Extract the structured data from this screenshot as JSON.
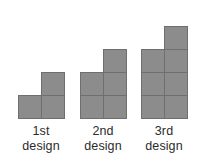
{
  "figure": {
    "background_color": "#ffffff",
    "square_fill_color": "#8c8c8c",
    "square_border_color": "#6f6f6f",
    "label_color": "#2b2b2b",
    "square_size_px": 24
  },
  "designs": [
    {
      "name": "1st design",
      "ordinal": "1st",
      "word": "design",
      "square_count": 3,
      "rows_bottom_to_top": [
        2,
        1
      ],
      "shape": "L-shape: two squares on the bottom row, one square above the right-hand square"
    },
    {
      "name": "2nd design",
      "ordinal": "2nd",
      "word": "design",
      "square_count": 5,
      "rows_bottom_to_top": [
        2,
        2,
        1
      ],
      "shape": "Two-by-two block with one extra square above the top-right square"
    },
    {
      "name": "3rd design",
      "ordinal": "3rd",
      "word": "design",
      "square_count": 7,
      "rows_bottom_to_top": [
        2,
        2,
        2,
        1
      ],
      "shape": "Two-by-three block with one extra square above the top-right square"
    }
  ],
  "chart_data": {
    "type": "bar",
    "title": "",
    "xlabel": "",
    "ylabel": "",
    "categories": [
      "1st design",
      "2nd design",
      "3rd design"
    ],
    "values": [
      3,
      5,
      7
    ],
    "value_label": "number of squares",
    "grid": false,
    "legend_position": "none",
    "annotations": [
      "Each design is built from unit squares arranged in a staircase pattern.",
      "Design n consists of a 2-by-n block of squares plus one additional square above the top-right square.",
      "Square counts follow the pattern 3, 5, 7 (increasing by 2 each time)."
    ]
  }
}
